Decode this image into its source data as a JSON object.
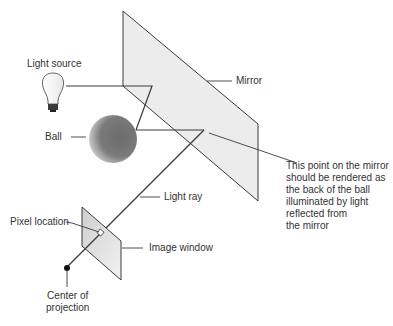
{
  "diagram": {
    "labels": {
      "light_source": "Light source",
      "mirror": "Mirror",
      "ball": "Ball",
      "light_ray": "Light ray",
      "pixel_location": "Pixel location",
      "image_window": "Image window",
      "center_of_projection_line1": "Center of",
      "center_of_projection_line2": "projection"
    },
    "note_lines": [
      "This point on the mirror",
      "should be rendered as",
      "the back of the ball",
      "illuminated by light",
      "reflected from",
      "the mirror"
    ],
    "colors": {
      "line": "#3a3a3a",
      "mirror_fill": "#ececec",
      "ball_dark": "#6a6a6a",
      "window_fill": "#e2e2e2"
    }
  }
}
